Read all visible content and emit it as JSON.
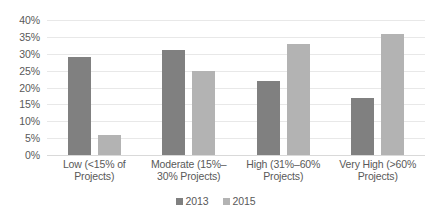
{
  "chart_data": {
    "type": "bar",
    "title": "",
    "subtitle": "",
    "xlabel": "",
    "ylabel": "",
    "ylim": [
      0,
      40
    ],
    "ytick_labels": [
      "40%",
      "35%",
      "30%",
      "25%",
      "20%",
      "15%",
      "10%",
      "5%",
      "0%"
    ],
    "ytick_values": [
      40,
      35,
      30,
      25,
      20,
      15,
      10,
      5,
      0
    ],
    "ytick_step": 5,
    "grid": true,
    "grid_axis": "y",
    "legend_position": "bottom-center",
    "categories": [
      "Low (<15% of Projects)",
      "Moderate (15%–30% Projects)",
      "High (31%–60% Projects)",
      "Very High (>60% Projects)"
    ],
    "series": [
      {
        "name": "2013",
        "color": "#808080",
        "values": [
          29,
          31,
          22,
          17
        ]
      },
      {
        "name": "2015",
        "color": "#b3b3b3",
        "values": [
          6,
          25,
          33,
          36
        ]
      }
    ]
  },
  "legend": {
    "items": [
      {
        "label": "2013",
        "color": "#808080"
      },
      {
        "label": "2015",
        "color": "#b3b3b3"
      }
    ]
  },
  "colors": {
    "series_2013": "#808080",
    "series_2015": "#b3b3b3",
    "text": "#595959",
    "gridline": "#e8e8e8",
    "background": "#ffffff"
  }
}
